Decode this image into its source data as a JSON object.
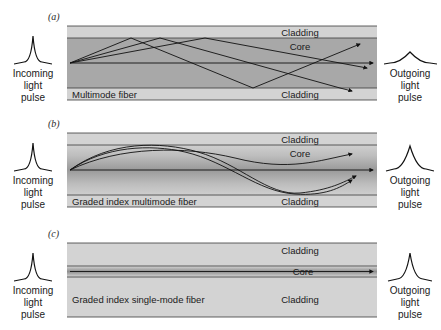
{
  "figure": {
    "background_color": "#ffffff",
    "width": 441,
    "height": 330
  },
  "colors": {
    "cladding_fill": "#d3d3d3",
    "core_fill": "#a8a8a8",
    "core_fill_light": "#c4c4c4",
    "graded_center": "#9a9a9a",
    "graded_edge": "#cfcfcf",
    "line": "#3a3a3a",
    "ray": "#111111",
    "text": "#1a1a1a"
  },
  "panels": [
    {
      "letter": "(a)",
      "fiber_name": "Multimode fiber",
      "cladding_top_label": "Cladding",
      "core_label": "Core",
      "cladding_bottom_label": "Cladding",
      "incoming_label_lines": [
        "Incoming",
        "light",
        "pulse"
      ],
      "outgoing_label_lines": [
        "Outgoing",
        "light",
        "pulse"
      ],
      "pulse_in_shape": "narrow-sharp",
      "pulse_out_shape": "broad-flat",
      "ray_style": "zigzag-step-index",
      "ray_count": 4,
      "dispersion": "high"
    },
    {
      "letter": "(b)",
      "fiber_name": "Graded index multimode fiber",
      "cladding_top_label": "Cladding",
      "core_label": "Core",
      "cladding_bottom_label": "Cladding",
      "incoming_label_lines": [
        "Incoming",
        "light",
        "pulse"
      ],
      "outgoing_label_lines": [
        "Outgoing",
        "light",
        "pulse"
      ],
      "pulse_in_shape": "narrow-sharp",
      "pulse_out_shape": "medium",
      "ray_style": "sinusoidal-graded-index",
      "ray_count": 4,
      "dispersion": "moderate"
    },
    {
      "letter": "(c)",
      "fiber_name": "Graded index single-mode fiber",
      "cladding_top_label": "Cladding",
      "core_label": "Core",
      "cladding_bottom_label": "Cladding",
      "incoming_label_lines": [
        "Incoming",
        "light",
        "pulse"
      ],
      "outgoing_label_lines": [
        "Outgoing",
        "light",
        "pulse"
      ],
      "pulse_in_shape": "narrow-sharp",
      "pulse_out_shape": "narrow-sharp",
      "ray_style": "straight-single-mode",
      "ray_count": 1,
      "dispersion": "minimal"
    }
  ]
}
